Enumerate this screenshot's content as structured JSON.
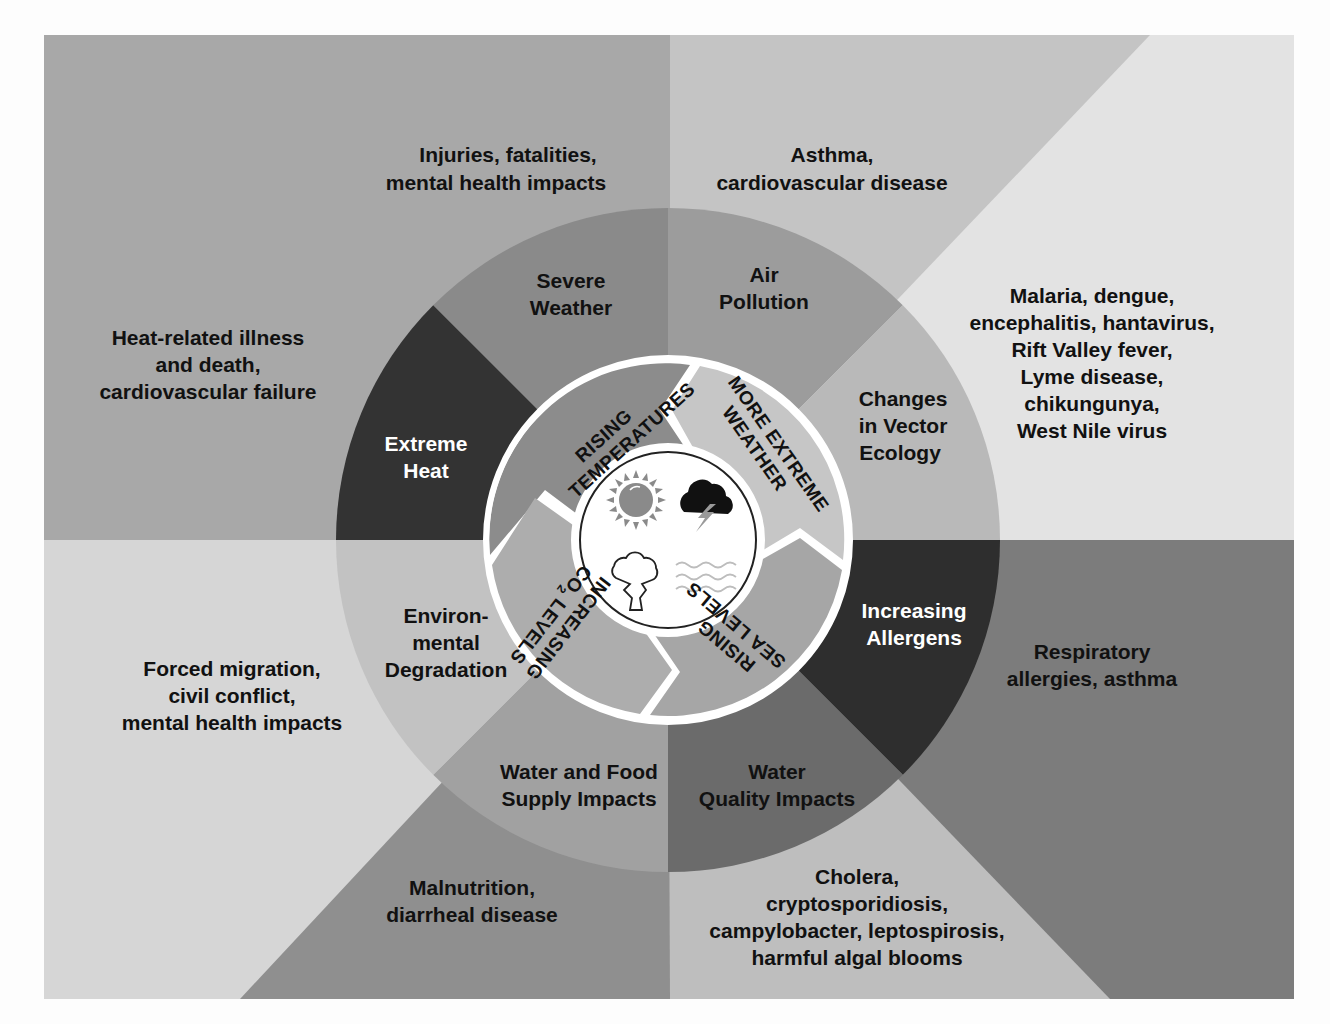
{
  "colors": {
    "background": "#fdfdfd",
    "frame_bg": "#a9a9a9",
    "q_tl": "#a8a8a8",
    "q_tr_left": "#c3c3c3",
    "q_tr_right": "#e2e2e2",
    "q_bl_left": "#d5d5d5",
    "q_bl_right": "#8f8f8f",
    "q_br_right": "#7c7c7c",
    "q_br_bottom": "#bdbdbd"
  },
  "center": {
    "icons": [
      "sun-icon",
      "storm-cloud-icon",
      "smoke-cloud-icon",
      "waves-icon"
    ]
  },
  "drivers": [
    {
      "id": "rising-temperatures",
      "lines": [
        "RISING",
        "TEMPERATURES"
      ]
    },
    {
      "id": "more-extreme-weather",
      "lines": [
        "MORE EXTREME",
        "WEATHER"
      ]
    },
    {
      "id": "rising-sea-levels",
      "lines": [
        "RISING",
        "SEA LEVELS"
      ]
    },
    {
      "id": "increasing-co2-levels",
      "lines": [
        "INCREASING",
        "CO",
        "2",
        " LEVELS"
      ]
    }
  ],
  "exposures": [
    {
      "id": "severe-weather",
      "lines": [
        "Severe",
        "Weather"
      ]
    },
    {
      "id": "air-pollution",
      "lines": [
        "Air",
        "Pollution"
      ]
    },
    {
      "id": "vector-ecology",
      "lines": [
        "Changes",
        "in Vector",
        "Ecology"
      ]
    },
    {
      "id": "increasing-allergens",
      "lines": [
        "Increasing",
        "Allergens"
      ]
    },
    {
      "id": "water-quality",
      "lines": [
        "Water",
        "Quality Impacts"
      ]
    },
    {
      "id": "water-food-supply",
      "lines": [
        "Water and Food",
        "Supply Impacts"
      ]
    },
    {
      "id": "environmental-degradation",
      "lines": [
        "Environ-",
        "mental",
        "Degradation"
      ]
    },
    {
      "id": "extreme-heat",
      "lines": [
        "Extreme",
        "Heat"
      ]
    }
  ],
  "health_impacts": [
    {
      "id": "severe-weather-impacts",
      "lines": [
        "Injuries, fatalities,",
        "mental health impacts"
      ]
    },
    {
      "id": "air-pollution-impacts",
      "lines": [
        "Asthma,",
        "cardiovascular disease"
      ]
    },
    {
      "id": "vector-impacts",
      "lines": [
        "Malaria, dengue,",
        "encephalitis, hantavirus,",
        "Rift Valley fever,",
        "Lyme disease,",
        "chikungunya,",
        "West Nile virus"
      ]
    },
    {
      "id": "allergen-impacts",
      "lines": [
        "Respiratory",
        "allergies, asthma"
      ]
    },
    {
      "id": "water-quality-impacts",
      "lines": [
        "Cholera,",
        "cryptosporidiosis,",
        "campylobacter, leptospirosis,",
        "harmful algal blooms"
      ]
    },
    {
      "id": "food-supply-impacts",
      "lines": [
        "Malnutrition,",
        "diarrheal disease"
      ]
    },
    {
      "id": "degradation-impacts",
      "lines": [
        "Forced migration,",
        "civil conflict,",
        "mental health impacts"
      ]
    },
    {
      "id": "heat-impacts",
      "lines": [
        "Heat-related illness",
        "and death,",
        "cardiovascular failure"
      ]
    }
  ]
}
